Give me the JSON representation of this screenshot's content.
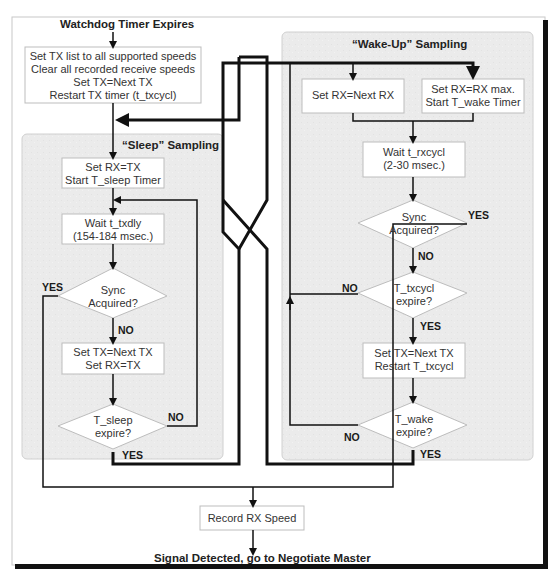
{
  "diagram": {
    "type": "flowchart",
    "start_label": "Watchdog Timer Expires",
    "end_label": "Signal Detected, go to Negotiate Master",
    "colors": {
      "panel_fill": "#ececec",
      "panel_border": "#cfcfcf",
      "box_fill": "#ffffff",
      "box_border": "#bdbdbd",
      "line": "#111111"
    },
    "init_box": {
      "lines": [
        "Set TX list to all supported speeds",
        "Clear all recorded receive speeds",
        "Set TX=Next TX",
        "Restart TX timer (t_txcycl)"
      ]
    },
    "sleep_panel": {
      "title": "“Sleep” Sampling",
      "box_start": [
        "Set RX=TX",
        "Start T_sleep Timer"
      ],
      "box_wait": [
        "Wait t_txdly",
        "(154-184 msec.)"
      ],
      "decision_sync": [
        "Sync",
        "Acquired?"
      ],
      "box_next": [
        "Set TX=Next TX",
        "Set RX=TX"
      ],
      "decision_expire": [
        "T_sleep",
        "expire?"
      ],
      "labels": {
        "sync_yes": "YES",
        "sync_no": "NO",
        "expire_no": "NO",
        "expire_yes": "YES"
      }
    },
    "wake_panel": {
      "title": "“Wake-Up” Sampling",
      "box_next_rx": [
        "Set RX=Next RX"
      ],
      "box_rx_max": [
        "Set RX=RX max.",
        "Start T_wake Timer"
      ],
      "box_wait": [
        "Wait t_rxcycl",
        "(2-30 msec.)"
      ],
      "decision_sync": [
        "Sync",
        "Acquired?"
      ],
      "decision_txcycl": [
        "T_txcycl",
        "expire?"
      ],
      "box_next_tx": [
        "Set TX=Next TX",
        "Restart T_txcycl"
      ],
      "decision_wake": [
        "T_wake",
        "expire?"
      ],
      "labels": {
        "sync_yes": "YES",
        "sync_no": "NO",
        "txcycl_no": "NO",
        "txcycl_yes": "YES",
        "wake_no": "NO",
        "wake_yes": "YES"
      }
    },
    "record_box": {
      "lines": [
        "Record RX Speed"
      ]
    }
  }
}
